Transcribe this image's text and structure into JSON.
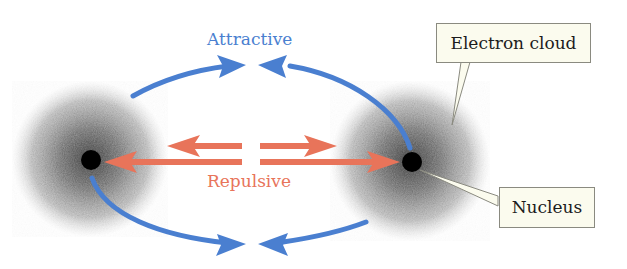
{
  "labels": {
    "attractive": "Attractive",
    "repulsive": "Repulsive",
    "electron_cloud": "Electron cloud",
    "nucleus": "Nucleus"
  },
  "colors": {
    "attractive": "#4a7fd0",
    "repulsive": "#e8745a",
    "nucleus": "#000000",
    "cloud_core": "#555555",
    "callout_bg": "#fbfbee",
    "callout_border": "#8a8a80"
  },
  "atoms": [
    {
      "name": "left-atom",
      "cx": 90,
      "cy": 159,
      "r": 76
    },
    {
      "name": "right-atom",
      "cx": 410,
      "cy": 161,
      "r": 78
    }
  ]
}
